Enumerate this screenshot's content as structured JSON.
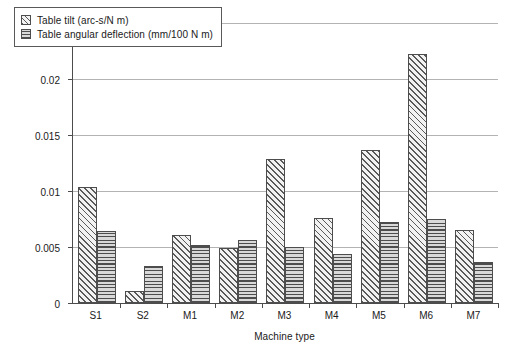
{
  "chart_data": {
    "type": "bar",
    "title": "",
    "xlabel": "Machine type",
    "ylabel": "Relative compliance",
    "categories": [
      "S1",
      "S2",
      "M1",
      "M2",
      "M3",
      "M4",
      "M5",
      "M6",
      "M7"
    ],
    "series": [
      {
        "name": "Table tilt (arc-s/N m)",
        "pattern": "diagonal-hatch",
        "values": [
          0.0104,
          0.0011,
          0.0061,
          0.0049,
          0.0129,
          0.0076,
          0.0137,
          0.0222,
          0.0065
        ]
      },
      {
        "name": "Table angular deflection (mm/100 N m)",
        "pattern": "horizontal-lines",
        "values": [
          0.0064,
          0.0033,
          0.0052,
          0.0056,
          0.005,
          0.0044,
          0.0072,
          0.0075,
          0.0037
        ]
      }
    ],
    "ylim": [
      0,
      0.025
    ],
    "yticks": [
      0,
      0.005,
      0.01,
      0.015,
      0.02,
      0.025
    ],
    "ytick_labels": [
      "0",
      "0.005",
      "0.01",
      "0.015",
      "0.02",
      "0.025"
    ],
    "grid": "horizontal",
    "legend_position": "top-left-inside",
    "colors": {
      "axis": "#4c4c4c",
      "gridline": "#b3b3b3",
      "bar_outline": "#4d4d4d",
      "tilt_fill": "#f2f2f2",
      "tilt_hatch": "#595959",
      "deflection_fill": "#d9d9d9",
      "deflection_hatch": "#4d4d4d",
      "text": "#1a1a1a",
      "background": "#ffffff"
    }
  }
}
